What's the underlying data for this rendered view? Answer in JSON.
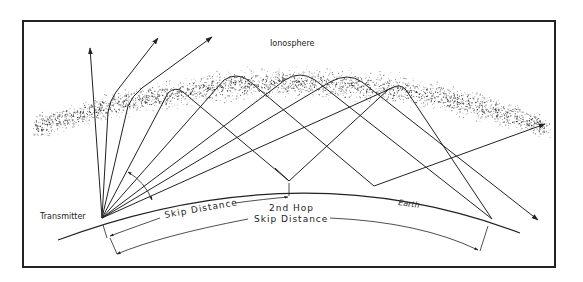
{
  "figure": {
    "labels": {
      "ionosphere": "Ionosphere",
      "transmitter": "Transmitter",
      "earth": "Earth",
      "skip_distance": "Skip Distance",
      "second_hop_line1": "2nd Hop",
      "second_hop_line2": "Skip Distance"
    },
    "colors": {
      "line": "#222222",
      "background": "#ffffff",
      "frame": "#222222",
      "ionosphere_dots": "#333333"
    },
    "elements": [
      {
        "type": "frame"
      },
      {
        "type": "ionosphere-layer",
        "description": "stippled curved band"
      },
      {
        "type": "earth-surface",
        "description": "curved arc"
      },
      {
        "type": "escaping-rays",
        "count": 3
      },
      {
        "type": "reflected-rays",
        "count": 5
      },
      {
        "type": "angle-arrow",
        "description": "critical/radiation angle indicator"
      },
      {
        "type": "dimension-line",
        "label": "Skip Distance"
      },
      {
        "type": "dimension-line",
        "label": "2nd Hop Skip Distance"
      }
    ]
  }
}
